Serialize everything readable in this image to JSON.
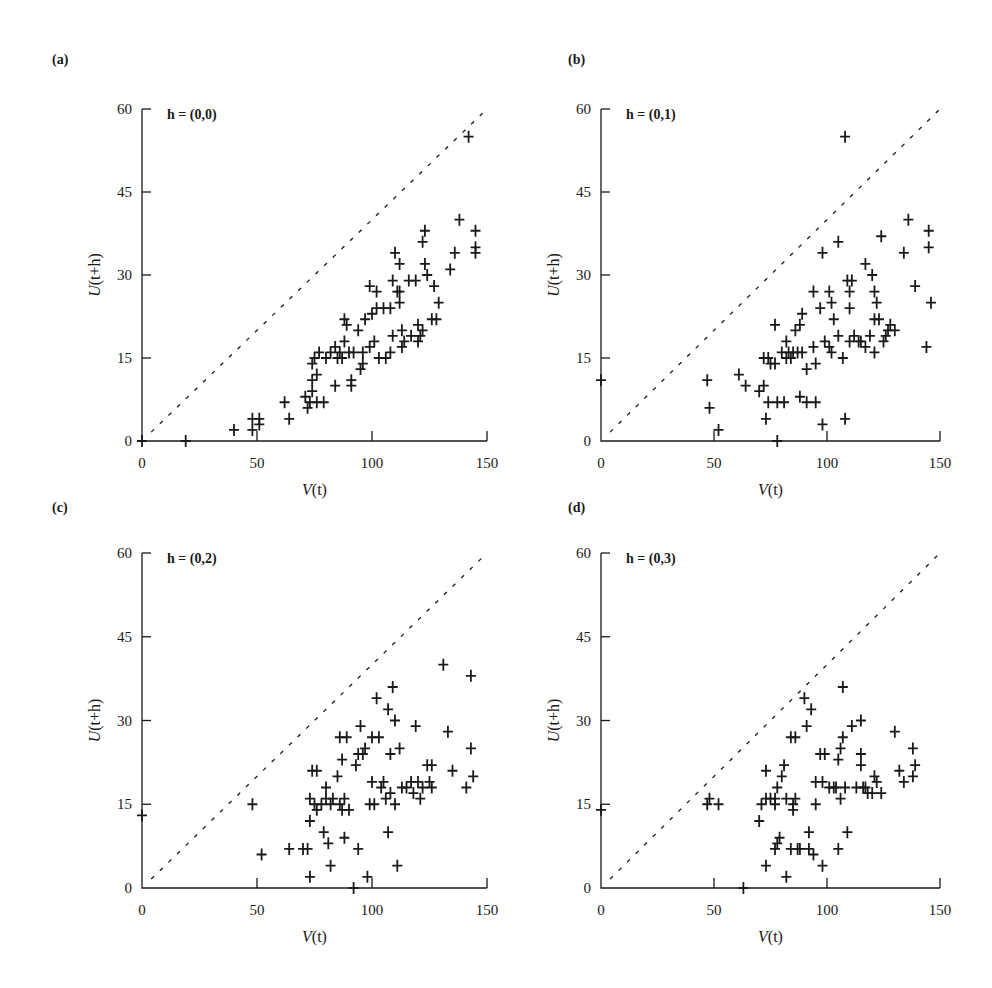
{
  "figure": {
    "panels": [
      {
        "id": "a",
        "label": "(a)",
        "h_label_bold": "h",
        "h_label_rest": " = (0,0)"
      },
      {
        "id": "b",
        "label": "(b)",
        "h_label_bold": "h",
        "h_label_rest": " = (0,1)"
      },
      {
        "id": "c",
        "label": "(c)",
        "h_label_bold": "h",
        "h_label_rest": " = (0,2)"
      },
      {
        "id": "d",
        "label": "(d)",
        "h_label_bold": "h",
        "h_label_rest": " = (0,3)"
      }
    ],
    "xlabel_italic": "V",
    "xlabel_rest": "(t)",
    "ylabel_italic": "U",
    "ylabel_rest": "(t+h)",
    "x_ticks": [
      "0",
      "50",
      "100",
      "150"
    ],
    "y_ticks": [
      "0",
      "15",
      "30",
      "45",
      "60"
    ]
  },
  "chart_data": [
    {
      "type": "scatter",
      "title": "h = (0,0)",
      "panel": "(a)",
      "xlabel": "V(t)",
      "ylabel": "U(t+h)",
      "xlim": [
        0,
        150
      ],
      "ylim": [
        0,
        60
      ],
      "x_ticks": [
        0,
        50,
        100,
        150
      ],
      "y_ticks": [
        0,
        15,
        30,
        45,
        60
      ],
      "reference_line": "y = 0.4x (dashed, from (0,0) to (150,60))",
      "marker": "+",
      "points": [
        [
          0,
          0
        ],
        [
          19,
          0
        ],
        [
          40,
          2
        ],
        [
          48,
          4
        ],
        [
          48,
          2
        ],
        [
          51,
          4
        ],
        [
          51,
          3
        ],
        [
          62,
          7
        ],
        [
          64,
          4
        ],
        [
          71,
          8
        ],
        [
          72,
          6
        ],
        [
          73,
          7
        ],
        [
          74,
          9
        ],
        [
          74,
          11
        ],
        [
          74,
          14
        ],
        [
          75,
          15
        ],
        [
          76,
          12
        ],
        [
          76,
          7
        ],
        [
          79,
          7
        ],
        [
          77,
          16
        ],
        [
          80,
          15
        ],
        [
          82,
          16
        ],
        [
          84,
          17
        ],
        [
          85,
          15
        ],
        [
          86,
          16
        ],
        [
          84,
          10
        ],
        [
          87,
          15
        ],
        [
          88,
          18
        ],
        [
          88,
          22
        ],
        [
          89,
          21
        ],
        [
          90,
          16
        ],
        [
          92,
          16
        ],
        [
          91,
          11
        ],
        [
          91,
          10
        ],
        [
          94,
          20
        ],
        [
          96,
          16
        ],
        [
          95,
          13
        ],
        [
          96,
          14
        ],
        [
          97,
          22
        ],
        [
          99,
          17
        ],
        [
          99,
          28
        ],
        [
          100,
          23
        ],
        [
          101,
          18
        ],
        [
          102,
          27
        ],
        [
          102,
          24
        ],
        [
          103,
          15
        ],
        [
          105,
          24
        ],
        [
          106,
          15
        ],
        [
          108,
          16
        ],
        [
          108,
          24
        ],
        [
          109,
          29
        ],
        [
          109,
          19
        ],
        [
          110,
          34
        ],
        [
          111,
          27
        ],
        [
          112,
          27
        ],
        [
          112,
          25
        ],
        [
          112,
          32
        ],
        [
          113,
          17
        ],
        [
          113,
          20
        ],
        [
          114,
          18
        ],
        [
          116,
          29
        ],
        [
          117,
          19
        ],
        [
          119,
          29
        ],
        [
          120,
          18
        ],
        [
          120,
          21
        ],
        [
          121,
          19
        ],
        [
          122,
          36
        ],
        [
          122,
          20
        ],
        [
          123,
          38
        ],
        [
          123,
          32
        ],
        [
          124,
          30
        ],
        [
          126,
          22
        ],
        [
          127,
          28
        ],
        [
          128,
          22
        ],
        [
          129,
          25
        ],
        [
          134,
          31
        ],
        [
          136,
          34
        ],
        [
          138,
          40
        ],
        [
          142,
          55
        ],
        [
          145,
          38
        ],
        [
          145,
          35
        ],
        [
          145,
          34
        ]
      ]
    },
    {
      "type": "scatter",
      "title": "h = (0,1)",
      "panel": "(b)",
      "xlabel": "V(t)",
      "ylabel": "U(t+h)",
      "xlim": [
        0,
        150
      ],
      "ylim": [
        0,
        60
      ],
      "x_ticks": [
        0,
        50,
        100,
        150
      ],
      "y_ticks": [
        0,
        15,
        30,
        45,
        60
      ],
      "reference_line": "y = 0.4x (dashed)",
      "marker": "+",
      "points": [
        [
          0,
          11
        ],
        [
          47,
          11
        ],
        [
          48,
          6
        ],
        [
          52,
          2
        ],
        [
          61,
          12
        ],
        [
          64,
          10
        ],
        [
          70,
          9
        ],
        [
          72,
          10
        ],
        [
          72,
          15
        ],
        [
          73,
          4
        ],
        [
          74,
          7
        ],
        [
          74,
          15
        ],
        [
          75,
          14
        ],
        [
          77,
          14
        ],
        [
          77,
          21
        ],
        [
          78,
          7
        ],
        [
          78,
          0
        ],
        [
          80,
          16
        ],
        [
          81,
          7
        ],
        [
          82,
          18
        ],
        [
          82,
          15
        ],
        [
          83,
          16
        ],
        [
          84,
          15
        ],
        [
          85,
          16
        ],
        [
          86,
          20
        ],
        [
          87,
          16
        ],
        [
          88,
          8
        ],
        [
          88,
          21
        ],
        [
          89,
          16
        ],
        [
          89,
          23
        ],
        [
          91,
          7
        ],
        [
          91,
          13
        ],
        [
          94,
          17
        ],
        [
          94,
          27
        ],
        [
          95,
          14
        ],
        [
          95,
          7
        ],
        [
          97,
          24
        ],
        [
          98,
          34
        ],
        [
          98,
          3
        ],
        [
          99,
          18
        ],
        [
          101,
          17
        ],
        [
          101,
          27
        ],
        [
          102,
          25
        ],
        [
          102,
          16
        ],
        [
          103,
          22
        ],
        [
          105,
          19
        ],
        [
          105,
          36
        ],
        [
          107,
          15
        ],
        [
          108,
          4
        ],
        [
          108,
          55
        ],
        [
          109,
          29
        ],
        [
          110,
          27
        ],
        [
          110,
          24
        ],
        [
          110,
          18
        ],
        [
          111,
          29
        ],
        [
          112,
          19
        ],
        [
          114,
          18
        ],
        [
          115,
          18
        ],
        [
          117,
          32
        ],
        [
          117,
          17
        ],
        [
          119,
          19
        ],
        [
          120,
          30
        ],
        [
          121,
          27
        ],
        [
          121,
          22
        ],
        [
          121,
          16
        ],
        [
          122,
          25
        ],
        [
          123,
          22
        ],
        [
          124,
          37
        ],
        [
          125,
          18
        ],
        [
          126,
          19
        ],
        [
          127,
          20
        ],
        [
          128,
          21
        ],
        [
          130,
          20
        ],
        [
          134,
          34
        ],
        [
          136,
          40
        ],
        [
          139,
          28
        ],
        [
          144,
          17
        ],
        [
          145,
          38
        ],
        [
          145,
          35
        ],
        [
          146,
          25
        ]
      ]
    },
    {
      "type": "scatter",
      "title": "h = (0,2)",
      "panel": "(c)",
      "xlabel": "V(t)",
      "ylabel": "U(t+h)",
      "xlim": [
        0,
        150
      ],
      "ylim": [
        0,
        60
      ],
      "x_ticks": [
        0,
        50,
        100,
        150
      ],
      "y_ticks": [
        0,
        15,
        30,
        45,
        60
      ],
      "reference_line": "y = 0.4x (dashed)",
      "marker": "+",
      "points": [
        [
          0,
          13
        ],
        [
          48,
          15
        ],
        [
          52,
          6
        ],
        [
          64,
          7
        ],
        [
          70,
          7
        ],
        [
          72,
          7
        ],
        [
          73,
          2
        ],
        [
          73,
          16
        ],
        [
          73,
          12
        ],
        [
          74,
          21
        ],
        [
          75,
          15
        ],
        [
          76,
          14
        ],
        [
          76,
          21
        ],
        [
          78,
          15
        ],
        [
          79,
          10
        ],
        [
          80,
          18
        ],
        [
          80,
          16
        ],
        [
          81,
          8
        ],
        [
          82,
          4
        ],
        [
          82,
          15
        ],
        [
          83,
          16
        ],
        [
          85,
          20
        ],
        [
          86,
          15
        ],
        [
          86,
          27
        ],
        [
          87,
          14
        ],
        [
          87,
          23
        ],
        [
          88,
          9
        ],
        [
          88,
          16
        ],
        [
          89,
          27
        ],
        [
          90,
          14
        ],
        [
          92,
          0
        ],
        [
          93,
          22
        ],
        [
          94,
          24
        ],
        [
          94,
          7
        ],
        [
          95,
          29
        ],
        [
          96,
          24
        ],
        [
          97,
          25
        ],
        [
          98,
          2
        ],
        [
          99,
          15
        ],
        [
          100,
          19
        ],
        [
          100,
          27
        ],
        [
          101,
          15
        ],
        [
          102,
          34
        ],
        [
          103,
          27
        ],
        [
          104,
          18
        ],
        [
          105,
          19
        ],
        [
          106,
          16
        ],
        [
          107,
          10
        ],
        [
          107,
          32
        ],
        [
          108,
          17
        ],
        [
          108,
          24
        ],
        [
          109,
          36
        ],
        [
          110,
          15
        ],
        [
          110,
          30
        ],
        [
          111,
          4
        ],
        [
          112,
          25
        ],
        [
          113,
          18
        ],
        [
          115,
          18
        ],
        [
          117,
          19
        ],
        [
          118,
          17
        ],
        [
          119,
          29
        ],
        [
          120,
          19
        ],
        [
          121,
          16
        ],
        [
          122,
          18
        ],
        [
          124,
          22
        ],
        [
          125,
          19
        ],
        [
          126,
          18
        ],
        [
          126,
          22
        ],
        [
          131,
          40
        ],
        [
          133,
          28
        ],
        [
          135,
          21
        ],
        [
          141,
          18
        ],
        [
          143,
          38
        ],
        [
          143,
          25
        ],
        [
          144,
          20
        ]
      ]
    },
    {
      "type": "scatter",
      "title": "h = (0,3)",
      "panel": "(d)",
      "xlabel": "V(t)",
      "ylabel": "U(t+h)",
      "xlim": [
        0,
        150
      ],
      "ylim": [
        0,
        60
      ],
      "x_ticks": [
        0,
        50,
        100,
        150
      ],
      "y_ticks": [
        0,
        15,
        30,
        45,
        60
      ],
      "reference_line": "y = 0.4x (dashed)",
      "marker": "+",
      "points": [
        [
          0,
          14
        ],
        [
          47,
          15
        ],
        [
          48,
          16
        ],
        [
          52,
          15
        ],
        [
          63,
          0
        ],
        [
          70,
          12
        ],
        [
          71,
          15
        ],
        [
          73,
          4
        ],
        [
          73,
          21
        ],
        [
          73,
          16
        ],
        [
          75,
          16
        ],
        [
          77,
          15
        ],
        [
          77,
          7
        ],
        [
          77,
          16
        ],
        [
          78,
          18
        ],
        [
          78,
          8
        ],
        [
          79,
          9
        ],
        [
          80,
          20
        ],
        [
          81,
          22
        ],
        [
          82,
          2
        ],
        [
          82,
          16
        ],
        [
          84,
          27
        ],
        [
          84,
          7
        ],
        [
          85,
          14
        ],
        [
          85,
          15
        ],
        [
          86,
          16
        ],
        [
          86,
          27
        ],
        [
          87,
          7
        ],
        [
          88,
          7
        ],
        [
          90,
          34
        ],
        [
          91,
          29
        ],
        [
          92,
          7
        ],
        [
          92,
          10
        ],
        [
          93,
          32
        ],
        [
          94,
          6
        ],
        [
          95,
          19
        ],
        [
          95,
          15
        ],
        [
          97,
          24
        ],
        [
          98,
          4
        ],
        [
          98,
          19
        ],
        [
          99,
          24
        ],
        [
          101,
          18
        ],
        [
          103,
          18
        ],
        [
          104,
          18
        ],
        [
          105,
          7
        ],
        [
          105,
          23
        ],
        [
          106,
          25
        ],
        [
          106,
          16
        ],
        [
          107,
          27
        ],
        [
          107,
          36
        ],
        [
          108,
          18
        ],
        [
          109,
          10
        ],
        [
          111,
          29
        ],
        [
          113,
          18
        ],
        [
          115,
          24
        ],
        [
          115,
          22
        ],
        [
          115,
          30
        ],
        [
          116,
          18
        ],
        [
          117,
          18
        ],
        [
          118,
          17
        ],
        [
          120,
          17
        ],
        [
          121,
          20
        ],
        [
          122,
          19
        ],
        [
          124,
          17
        ],
        [
          130,
          28
        ],
        [
          132,
          21
        ],
        [
          134,
          19
        ],
        [
          138,
          25
        ],
        [
          138,
          20
        ],
        [
          139,
          22
        ]
      ]
    }
  ]
}
